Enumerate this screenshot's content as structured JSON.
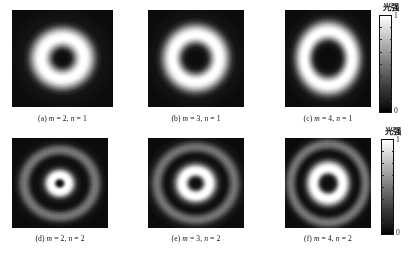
{
  "figure": {
    "type": "intensity-pattern-grid",
    "background_color": "#ffffff",
    "rows": 2,
    "columns": 3
  },
  "panels": [
    {
      "id": "a",
      "caption_prefix": "(a)",
      "caption": "(a) m = 2, n = 1",
      "m": 2,
      "n": 1,
      "rings": 1,
      "description": "single bright annulus with dark core"
    },
    {
      "id": "b",
      "caption_prefix": "(b)",
      "caption": "(b) m = 3, n = 1",
      "m": 3,
      "n": 1,
      "rings": 1,
      "description": "single bright annulus, larger dark core"
    },
    {
      "id": "c",
      "caption_prefix": "(c)",
      "caption": "(c) m = 4, n = 1",
      "m": 4,
      "n": 1,
      "rings": 1,
      "description": "single bright annulus, largest dark core"
    },
    {
      "id": "d",
      "caption_prefix": "(d)",
      "caption": "(d) m = 2, n = 2",
      "m": 2,
      "n": 2,
      "rings": 2,
      "description": "two bright annuli, small dark core"
    },
    {
      "id": "e",
      "caption_prefix": "(e)",
      "caption": "(e) m = 3, n = 2",
      "m": 3,
      "n": 2,
      "rings": 2,
      "description": "two bright annuli, medium dark core"
    },
    {
      "id": "f",
      "caption_prefix": "(f)",
      "caption": "(f) m = 4, n = 2",
      "m": 4,
      "n": 2,
      "rings": 2,
      "description": "two bright annuli, large dark core"
    }
  ],
  "colorbars": [
    {
      "id": "top",
      "title": "光强",
      "max_label": "1",
      "min_label": "0",
      "gradient_low_color": "#000000",
      "gradient_high_color": "#ffffff"
    },
    {
      "id": "bottom",
      "title": "光强",
      "max_label": "1",
      "min_label": "0",
      "gradient_low_color": "#000000",
      "gradient_high_color": "#ffffff"
    }
  ],
  "chart_data": {
    "type": "heatmap",
    "title": "",
    "xlabel": "",
    "ylabel": "",
    "colormap": "grayscale",
    "colorbar_label": "光强",
    "colorbar_range": [
      0,
      1
    ],
    "panels": [
      {
        "label": "(a) m = 2, n = 1",
        "m": 2,
        "n": 1,
        "radial_rings": 1,
        "radial_profile_r": [
          0.0,
          0.06,
          0.12,
          0.18,
          0.24,
          0.3,
          0.36,
          0.42,
          0.48,
          0.54,
          0.62,
          0.72,
          0.85,
          1.0
        ],
        "radial_profile_intensity": [
          0.02,
          0.03,
          0.06,
          0.18,
          0.45,
          0.78,
          0.97,
          1.0,
          0.95,
          0.75,
          0.42,
          0.16,
          0.05,
          0.02
        ]
      },
      {
        "label": "(b) m = 3, n = 1",
        "m": 3,
        "n": 1,
        "radial_rings": 1,
        "radial_profile_r": [
          0.0,
          0.08,
          0.16,
          0.24,
          0.3,
          0.36,
          0.42,
          0.48,
          0.54,
          0.6,
          0.68,
          0.78,
          0.9,
          1.0
        ],
        "radial_profile_intensity": [
          0.02,
          0.02,
          0.04,
          0.12,
          0.32,
          0.66,
          0.92,
          1.0,
          0.96,
          0.76,
          0.44,
          0.17,
          0.05,
          0.02
        ]
      },
      {
        "label": "(c) m = 4, n = 1",
        "m": 4,
        "n": 1,
        "radial_rings": 1,
        "radial_profile_r": [
          0.0,
          0.1,
          0.2,
          0.28,
          0.34,
          0.4,
          0.46,
          0.52,
          0.58,
          0.64,
          0.72,
          0.82,
          0.92,
          1.0
        ],
        "radial_profile_intensity": [
          0.02,
          0.02,
          0.03,
          0.08,
          0.24,
          0.58,
          0.9,
          1.0,
          0.97,
          0.78,
          0.45,
          0.16,
          0.05,
          0.02
        ]
      },
      {
        "label": "(d) m = 2, n = 2",
        "m": 2,
        "n": 2,
        "radial_rings": 2,
        "radial_profile_r": [
          0.0,
          0.05,
          0.1,
          0.16,
          0.22,
          0.3,
          0.38,
          0.46,
          0.54,
          0.62,
          0.7,
          0.78,
          0.88,
          1.0
        ],
        "radial_profile_intensity": [
          0.03,
          0.05,
          0.45,
          0.95,
          1.0,
          0.6,
          0.1,
          0.04,
          0.1,
          0.42,
          0.55,
          0.3,
          0.06,
          0.02
        ]
      },
      {
        "label": "(e) m = 3, n = 2",
        "m": 3,
        "n": 2,
        "radial_rings": 2,
        "radial_profile_r": [
          0.0,
          0.06,
          0.12,
          0.2,
          0.27,
          0.34,
          0.42,
          0.5,
          0.58,
          0.66,
          0.74,
          0.82,
          0.9,
          1.0
        ],
        "radial_profile_intensity": [
          0.03,
          0.04,
          0.12,
          0.62,
          1.0,
          0.85,
          0.22,
          0.05,
          0.12,
          0.44,
          0.55,
          0.28,
          0.06,
          0.02
        ]
      },
      {
        "label": "(f) m = 4, n = 2",
        "m": 4,
        "n": 2,
        "radial_rings": 2,
        "radial_profile_r": [
          0.0,
          0.07,
          0.14,
          0.22,
          0.29,
          0.36,
          0.44,
          0.52,
          0.6,
          0.68,
          0.76,
          0.84,
          0.92,
          1.0
        ],
        "radial_profile_intensity": [
          0.03,
          0.04,
          0.08,
          0.45,
          0.95,
          1.0,
          0.4,
          0.07,
          0.12,
          0.45,
          0.58,
          0.3,
          0.06,
          0.02
        ]
      }
    ]
  }
}
